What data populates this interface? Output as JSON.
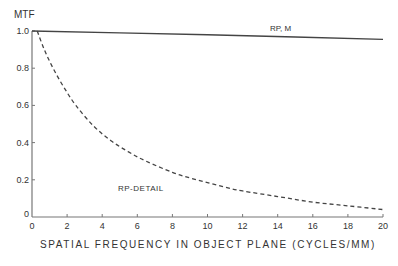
{
  "chart_data": {
    "type": "line",
    "title": "",
    "xlabel": "SPATIAL FREQUENCY IN OBJECT PLANE (CYCLES/MM)",
    "ylabel": "MTF",
    "xlim": [
      0,
      20
    ],
    "ylim": [
      0,
      1.0
    ],
    "grid": false,
    "legend": "inline annotations",
    "x_ticks": [
      "0",
      "2",
      "4",
      "6",
      "8",
      "10",
      "12",
      "14",
      "16",
      "18",
      "20"
    ],
    "y_ticks": [
      "0",
      "0.2",
      "0.4",
      "0.6",
      "0.8",
      "1.0"
    ],
    "series": [
      {
        "name": "RP, M",
        "style": "solid",
        "x": [
          0,
          5,
          10,
          15,
          20
        ],
        "y": [
          1.0,
          0.99,
          0.98,
          0.968,
          0.955
        ]
      },
      {
        "name": "RP-DETAIL",
        "style": "dashed",
        "x": [
          0.3,
          0.7,
          1.2,
          1.8,
          2.5,
          3.5,
          4.5,
          5.5,
          6.5,
          8,
          9,
          10,
          11,
          12,
          14,
          16,
          18,
          20
        ],
        "y": [
          1.0,
          0.9,
          0.8,
          0.7,
          0.6,
          0.49,
          0.41,
          0.35,
          0.3,
          0.24,
          0.21,
          0.185,
          0.16,
          0.14,
          0.11,
          0.08,
          0.06,
          0.04
        ]
      }
    ],
    "annotations": [
      {
        "text": "RP, M",
        "x": 14,
        "y": 1.0
      },
      {
        "text": "RP-DETAIL",
        "x": 6.3,
        "y": 0.17
      }
    ]
  },
  "labels": {
    "y_axis_title": "MTF",
    "x_axis_title": "SPATIAL FREQUENCY IN OBJECT PLANE (CYCLES/MM)",
    "series_a_label": "RP, M",
    "series_b_label": "RP-DETAIL"
  }
}
